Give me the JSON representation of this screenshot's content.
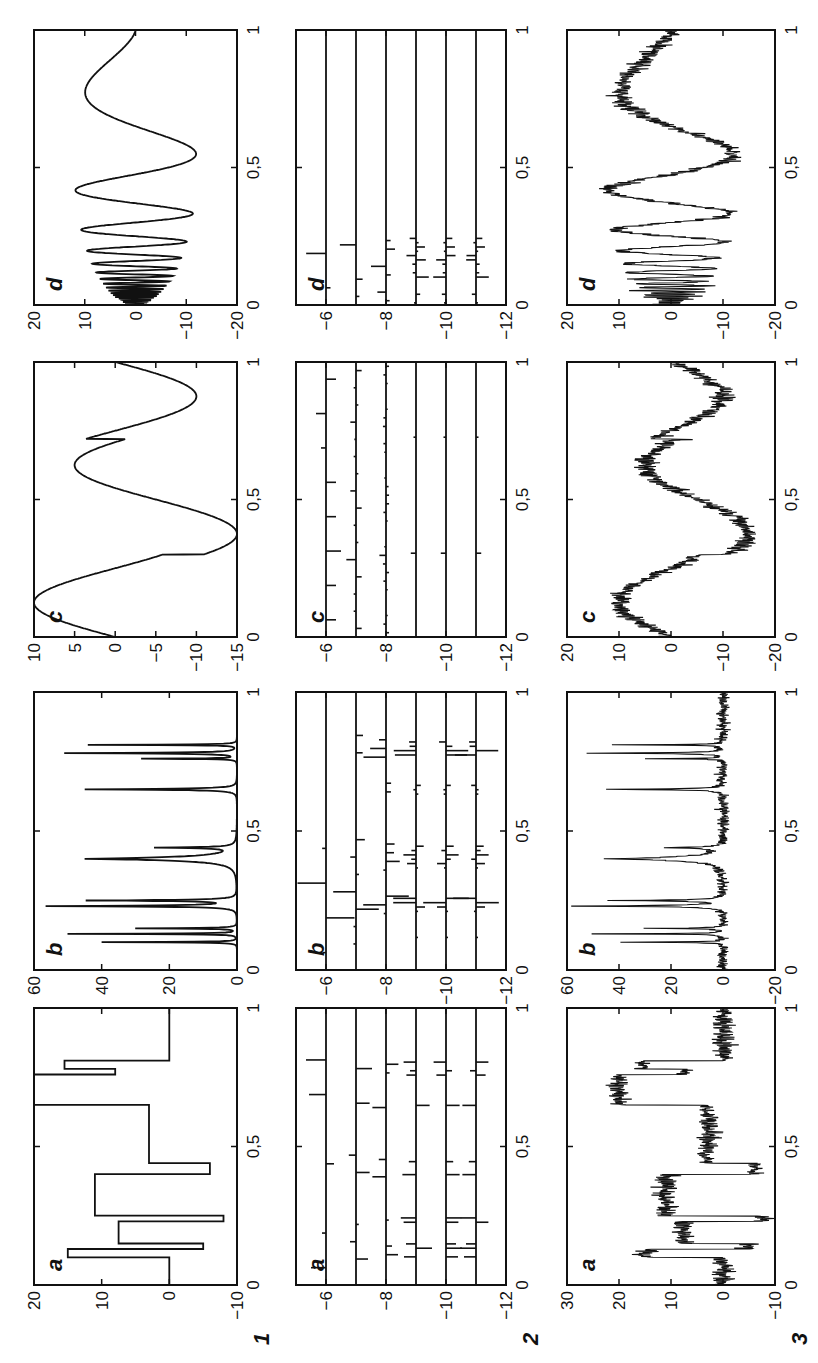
{
  "figure": {
    "rows": [
      {
        "label": "1",
        "description": "test signals"
      },
      {
        "label": "2",
        "description": "wavelet coefficients"
      },
      {
        "label": "3",
        "description": "noisy signals"
      }
    ],
    "columns": [
      "a",
      "b",
      "c",
      "d"
    ],
    "xtick_labels": [
      "0",
      "0,5",
      "1"
    ]
  },
  "chart_data": [
    {
      "id": "1a",
      "row": "1",
      "panel": "a",
      "type": "line",
      "title": "",
      "xlabel": "",
      "ylabel": "",
      "xlim": [
        0,
        1
      ],
      "ylim": [
        -10,
        20
      ],
      "yticks": [
        "20",
        "10",
        "0",
        "-10"
      ],
      "x": [
        0,
        0.1,
        0.1,
        0.13,
        0.13,
        0.15,
        0.15,
        0.23,
        0.23,
        0.25,
        0.25,
        0.4,
        0.4,
        0.44,
        0.44,
        0.65,
        0.65,
        0.76,
        0.76,
        0.78,
        0.78,
        0.81,
        0.81,
        1
      ],
      "y": [
        0,
        0,
        15,
        15,
        -5,
        -5,
        7.5,
        7.5,
        -8,
        -8,
        11,
        11,
        -6,
        -6,
        3,
        3,
        20,
        20,
        8,
        8,
        15.5,
        15.5,
        0,
        0
      ]
    },
    {
      "id": "1b",
      "row": "1",
      "panel": "b",
      "type": "line",
      "xlim": [
        0,
        1
      ],
      "ylim": [
        0,
        60
      ],
      "yticks": [
        "60",
        "40",
        "20",
        "0"
      ],
      "peaks": [
        {
          "x": 0.1,
          "y": 40
        },
        {
          "x": 0.13,
          "y": 50
        },
        {
          "x": 0.15,
          "y": 30
        },
        {
          "x": 0.23,
          "y": 56
        },
        {
          "x": 0.25,
          "y": 44
        },
        {
          "x": 0.4,
          "y": 45
        },
        {
          "x": 0.44,
          "y": 23
        },
        {
          "x": 0.65,
          "y": 45
        },
        {
          "x": 0.76,
          "y": 28
        },
        {
          "x": 0.78,
          "y": 51
        },
        {
          "x": 0.81,
          "y": 44
        }
      ]
    },
    {
      "id": "1c",
      "row": "1",
      "panel": "c",
      "type": "line",
      "xlim": [
        0,
        1
      ],
      "ylim": [
        -15,
        10
      ],
      "yticks": [
        "10",
        "5",
        "0",
        "-5",
        "-10",
        "-15"
      ],
      "x": [
        0,
        0.05,
        0.12,
        0.2,
        0.28,
        0.29,
        0.33,
        0.38,
        0.45,
        0.55,
        0.62,
        0.67,
        0.7,
        0.72,
        0.75,
        0.8,
        0.87,
        0.95,
        1
      ],
      "y": [
        1,
        6,
        9.5,
        4,
        -4.5,
        -9.5,
        -12.5,
        -14,
        -10,
        -1,
        4,
        2.5,
        -4.5,
        -3.5,
        -1.5,
        -6,
        -11.5,
        -7,
        0
      ]
    },
    {
      "id": "1d",
      "row": "1",
      "panel": "d",
      "type": "line",
      "xlim": [
        0,
        1
      ],
      "ylim": [
        -20,
        20
      ],
      "yticks": [
        "20",
        "10",
        "0",
        "-10",
        "-20"
      ],
      "description": "Doppler: chirp oscillations with growing amplitude, ~±12 at x=0.4–0.55, peak +10 at x≈0.78, ends ~0 at x=1"
    },
    {
      "id": "2a",
      "row": "2",
      "panel": "a",
      "type": "heatmap",
      "xlim": [
        0,
        1
      ],
      "ylim": [
        -12,
        -5
      ],
      "yticks": [
        "-6",
        "-8",
        "-10",
        "-12"
      ],
      "levels": [
        -6,
        -7,
        -8,
        -9,
        -10,
        -11
      ],
      "description": "wavelet coefficient stems at each scale level"
    },
    {
      "id": "2b",
      "row": "2",
      "panel": "b",
      "type": "heatmap",
      "xlim": [
        0,
        1
      ],
      "ylim": [
        -12,
        -5
      ],
      "yticks": [
        "-6",
        "-8",
        "-10",
        "-12"
      ],
      "levels": [
        -6,
        -7,
        -8,
        -9,
        -10,
        -11
      ]
    },
    {
      "id": "2c",
      "row": "2",
      "panel": "c",
      "type": "heatmap",
      "xlim": [
        0,
        1
      ],
      "ylim": [
        -12,
        -5
      ],
      "yticks": [
        "-6",
        "-8",
        "-10",
        "-12"
      ],
      "levels": [
        -6,
        -7,
        -8,
        -9,
        -10,
        -11
      ],
      "coefficient_positions": [
        0.3,
        0.72
      ]
    },
    {
      "id": "2d",
      "row": "2",
      "panel": "d",
      "type": "heatmap",
      "xlim": [
        0,
        1
      ],
      "ylim": [
        -12,
        -5
      ],
      "yticks": [
        "-6",
        "-8",
        "-10",
        "-12"
      ],
      "levels": [
        -6,
        -7,
        -8,
        -9,
        -10,
        -11
      ],
      "description": "coefficients concentrated near x<0.25"
    },
    {
      "id": "3a",
      "row": "3",
      "panel": "a",
      "type": "line",
      "xlim": [
        0,
        1
      ],
      "ylim": [
        -10,
        30
      ],
      "yticks": [
        "30",
        "20",
        "10",
        "0",
        "-10"
      ],
      "description": "Blocks + noise"
    },
    {
      "id": "3b",
      "row": "3",
      "panel": "b",
      "type": "line",
      "xlim": [
        0,
        1
      ],
      "ylim": [
        -20,
        60
      ],
      "yticks": [
        "60",
        "40",
        "20",
        "0",
        "-20"
      ],
      "description": "Bumps + noise"
    },
    {
      "id": "3c",
      "row": "3",
      "panel": "c",
      "type": "line",
      "xlim": [
        0,
        1
      ],
      "ylim": [
        -20,
        20
      ],
      "yticks": [
        "20",
        "10",
        "0",
        "-10",
        "-20"
      ],
      "description": "HeaviSine + noise"
    },
    {
      "id": "3d",
      "row": "3",
      "panel": "d",
      "type": "line",
      "xlim": [
        0,
        1
      ],
      "ylim": [
        -20,
        20
      ],
      "yticks": [
        "20",
        "10",
        "0",
        "-10",
        "-20"
      ],
      "description": "Doppler + noise"
    }
  ]
}
